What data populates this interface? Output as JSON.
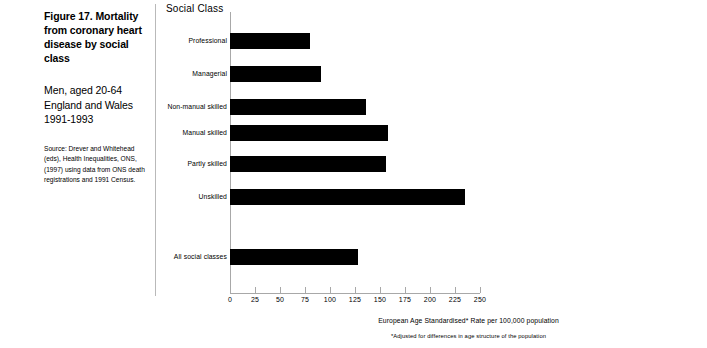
{
  "caption": {
    "title": "Figure 17. Mortality from coronary heart disease by social class",
    "subtitle": "Men, aged 20-64 England and Wales 1991-1993",
    "source": "Source: Drever and Whitehead (eds), Health Inequalities, ONS, (1997) using data from ONS death registrations and 1991 Census."
  },
  "chart_data": {
    "type": "bar",
    "orientation": "horizontal",
    "title": "Figure 17. Mortality from coronary heart disease by social class",
    "subtitle": "Men, aged 20-64 England and Wales 1991-1993",
    "group_title": "Social Class",
    "categories": [
      "Professional",
      "Managerial",
      "Non-manual skilled",
      "Manual skilled",
      "Partly skilled",
      "Unskilled",
      "All social classes"
    ],
    "values": [
      80,
      91,
      136,
      158,
      156,
      235,
      128
    ],
    "xlabel": "European Age Standardised* Rate per 100,000 population",
    "ylabel": "Social Class",
    "footnote": "*Adjusted for differences in age structure of the population",
    "xlim": [
      0,
      250
    ],
    "xticks": [
      0,
      25,
      50,
      75,
      100,
      125,
      150,
      175,
      200,
      225,
      250
    ],
    "grid": false,
    "legend": "none",
    "bar_color": "#000000"
  },
  "colors": {
    "bar": "#000000",
    "axis": "#a8a8a8",
    "divider": "#b9b9b9",
    "text": "#000000",
    "background": "#ffffff"
  }
}
